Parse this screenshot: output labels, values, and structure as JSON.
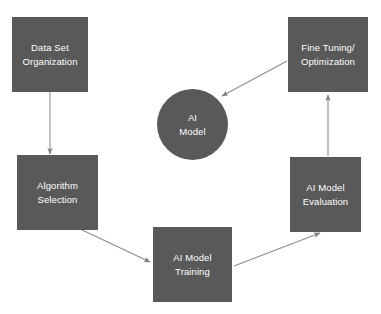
{
  "diagram": {
    "type": "cycle-flowchart",
    "background_color": "#ffffff",
    "node_fill_color": "#595959",
    "node_text_color": "#ffffff",
    "edge_color": "#808080",
    "nodes": [
      {
        "id": "data-set-organization",
        "label": "Data Set\nOrganization",
        "shape": "rectangle",
        "x": 12,
        "y": 17,
        "w": 76,
        "h": 75
      },
      {
        "id": "algorithm-selection",
        "label": "Algorithm\nSelection",
        "shape": "rectangle",
        "x": 17,
        "y": 155,
        "w": 81,
        "h": 75
      },
      {
        "id": "ai-model-training",
        "label": "AI Model\nTraining",
        "shape": "rectangle",
        "x": 153,
        "y": 227,
        "w": 79,
        "h": 75
      },
      {
        "id": "ai-model-evaluation",
        "label": "AI Model\nEvaluation",
        "shape": "rectangle",
        "x": 290,
        "y": 157,
        "w": 71,
        "h": 75
      },
      {
        "id": "fine-tuning-optimization",
        "label": "Fine Tuning/\nOptimization",
        "shape": "rectangle",
        "x": 288,
        "y": 17,
        "w": 80,
        "h": 75
      },
      {
        "id": "ai-model",
        "label": "AI\nModel",
        "shape": "circle",
        "x": 157,
        "y": 89,
        "w": 71,
        "h": 71
      }
    ],
    "edges": [
      {
        "id": "edge-dataset-to-algorithm",
        "from": "data-set-organization",
        "to": "algorithm-selection",
        "x1": 50,
        "y1": 92,
        "x2": 50,
        "y2": 154
      },
      {
        "id": "edge-algorithm-to-training",
        "from": "algorithm-selection",
        "to": "ai-model-training",
        "x1": 78,
        "y1": 228,
        "x2": 151,
        "y2": 263
      },
      {
        "id": "edge-training-to-evaluation",
        "from": "ai-model-training",
        "to": "ai-model-evaluation",
        "x1": 234,
        "y1": 266,
        "x2": 320,
        "y2": 234
      },
      {
        "id": "edge-evaluation-to-finetuning",
        "from": "ai-model-evaluation",
        "to": "fine-tuning-optimization",
        "x1": 328,
        "y1": 156,
        "x2": 328,
        "y2": 94
      },
      {
        "id": "edge-finetuning-to-aimodel",
        "from": "fine-tuning-optimization",
        "to": "ai-model",
        "x1": 287,
        "y1": 61,
        "x2": 221,
        "y2": 97
      }
    ]
  }
}
